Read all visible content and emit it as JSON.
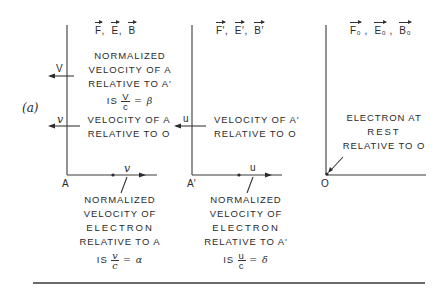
{
  "figure_label": "(a)",
  "frames": [
    {
      "id": "A",
      "origin_label": "A",
      "fields_header": [
        "F",
        "E",
        "B"
      ],
      "frame_velocity_symbol": "V",
      "frame_velocity_text": [
        "NORMALIZED",
        "VELOCITY OF A",
        "RELATIVE TO A′"
      ],
      "frame_velocity_eq": {
        "prefix": "IS",
        "num": "V",
        "den": "c",
        "result": "= β"
      },
      "velocity_rel_O_symbol": "v",
      "velocity_rel_O_text": [
        "VELOCITY OF A",
        "RELATIVE TO O"
      ],
      "electron_velocity_symbol": "v",
      "electron_text": [
        "NORMALIZED",
        "VELOCITY OF",
        "ELECTRON",
        "RELATIVE TO A"
      ],
      "electron_eq": {
        "prefix": "IS",
        "num": "v",
        "den": "c",
        "result": "= α"
      }
    },
    {
      "id": "A-prime",
      "origin_label": "A′",
      "fields_header": [
        "F′",
        "E′",
        "B′"
      ],
      "velocity_rel_O_symbol": "u",
      "velocity_rel_O_text": [
        "VELOCITY OF A′",
        "RELATIVE TO O"
      ],
      "electron_velocity_symbol": "u",
      "electron_text": [
        "NORMALIZED",
        "VELOCITY OF",
        "ELECTRON",
        "RELATIVE TO A′"
      ],
      "electron_eq": {
        "prefix": "IS",
        "num": "u",
        "den": "c",
        "result": "= δ"
      }
    },
    {
      "id": "O",
      "origin_label": "O",
      "fields_header": [
        "F₀",
        "E₀",
        "B₀"
      ],
      "electron_text": [
        "ELECTRON AT",
        "REST",
        "RELATIVE TO O"
      ]
    }
  ],
  "colors": {
    "ink": "#2b2b2b",
    "background": "#ffffff"
  }
}
